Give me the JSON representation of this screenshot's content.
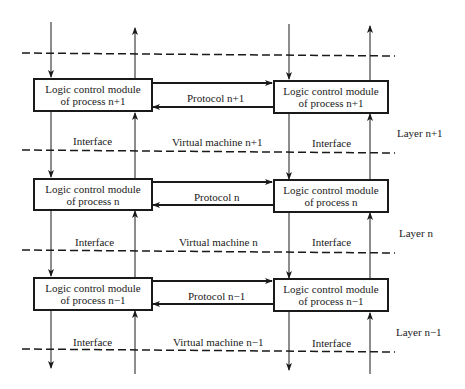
{
  "diagram": {
    "layers": [
      {
        "layer_label": "Layer n+1",
        "left_module": {
          "line1": "Logic control module",
          "line2": "of process n+1"
        },
        "right_module": {
          "line1": "Logic control module",
          "line2": "of process n+1"
        },
        "protocol_label": "Protocol n+1",
        "interface_left": "Interface",
        "interface_right": "Interface",
        "virtual_machine": "Virtual machine n+1"
      },
      {
        "layer_label": "Layer n",
        "left_module": {
          "line1": "Logic control module",
          "line2": "of process n"
        },
        "right_module": {
          "line1": "Logic control module",
          "line2": "of process n"
        },
        "protocol_label": "Protocol n",
        "interface_left": "Interface",
        "interface_right": "Interface",
        "virtual_machine": "Virtual machine n"
      },
      {
        "layer_label": "Layer n−1",
        "left_module": {
          "line1": "Logic control module",
          "line2": "of process n−1"
        },
        "right_module": {
          "line1": "Logic control module",
          "line2": "of process n−1"
        },
        "protocol_label": "Protocol n−1",
        "interface_left": "Interface",
        "interface_right": "Interface",
        "virtual_machine": "Virtual machine n−1"
      }
    ],
    "colors": {
      "ink": "#1a1a1a",
      "background": "#ffffff"
    }
  }
}
